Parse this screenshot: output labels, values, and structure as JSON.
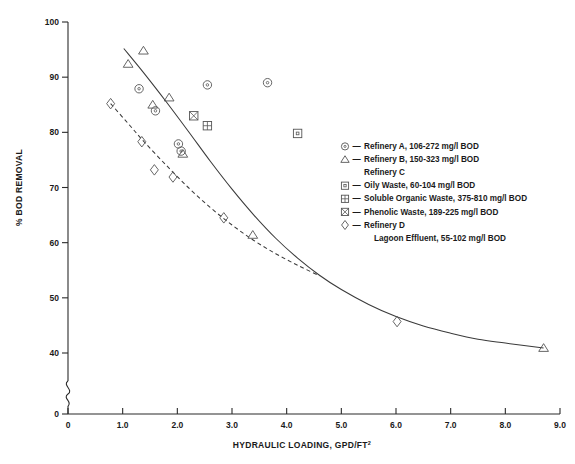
{
  "chart_data": {
    "type": "scatter",
    "title": "",
    "xlabel": "HYDRAULIC LOADING, GPD/FT",
    "xlabel_sup": "2",
    "ylabel": "% BOD REMOVAL",
    "xlim": [
      0,
      9.0
    ],
    "ylim": [
      40,
      100
    ],
    "y_axis_break": true,
    "y_break_label": "0",
    "grid": false,
    "xticks": [
      "0",
      "1.0",
      "2.0",
      "3.0",
      "4.0",
      "5.0",
      "6.0",
      "7.0",
      "8.0",
      "9.0"
    ],
    "xtick_values": [
      0,
      1,
      2,
      3,
      4,
      5,
      6,
      7,
      8,
      9
    ],
    "yticks": [
      "40",
      "50",
      "60",
      "70",
      "80",
      "90",
      "100"
    ],
    "ytick_values": [
      40,
      50,
      60,
      70,
      80,
      90,
      100
    ],
    "legend_position": "right",
    "legend": [
      {
        "symbol": "circle",
        "dash": "—",
        "label": "Refinery A, 106-272 mg/l BOD"
      },
      {
        "symbol": "triangle",
        "dash": "—",
        "label": "Refinery B, 150-323 mg/l BOD"
      },
      {
        "symbol": "none",
        "dash": "",
        "label": "Refinery C"
      },
      {
        "symbol": "square",
        "dash": "—",
        "label": "Oily Waste, 60-104 mg/l BOD"
      },
      {
        "symbol": "square-plus",
        "dash": "—",
        "label": "Soluble Organic Waste, 375-810 mg/l BOD"
      },
      {
        "symbol": "square-cross",
        "dash": "—",
        "label": "Phenolic Waste, 189-225 mg/l BOD"
      },
      {
        "symbol": "diamond",
        "dash": "—",
        "label": "Refinery D"
      },
      {
        "symbol": "none",
        "dash": "",
        "label": "Lagoon Effluent, 55-102 mg/l BOD"
      }
    ],
    "series": [
      {
        "name": "Refinery A, 106-272 mg/l BOD",
        "symbol": "circle",
        "points": [
          [
            1.3,
            87.9
          ],
          [
            1.6,
            83.9
          ],
          [
            2.02,
            77.9
          ],
          [
            2.55,
            88.6
          ],
          [
            3.65,
            89.0
          ],
          [
            2.07,
            76.6
          ]
        ]
      },
      {
        "name": "Refinery B, 150-323 mg/l BOD",
        "symbol": "triangle",
        "points": [
          [
            1.1,
            92.4
          ],
          [
            1.38,
            94.8
          ],
          [
            1.55,
            85.0
          ],
          [
            1.85,
            86.3
          ],
          [
            2.1,
            76.1
          ],
          [
            3.38,
            61.4
          ],
          [
            8.7,
            40.9
          ]
        ]
      },
      {
        "name": "Oily Waste, 60-104 mg/l BOD",
        "symbol": "square",
        "points": [
          [
            4.2,
            79.8
          ]
        ]
      },
      {
        "name": "Soluble Organic Waste, 375-810 mg/l BOD",
        "symbol": "square-plus",
        "points": [
          [
            2.55,
            81.2
          ]
        ]
      },
      {
        "name": "Phenolic Waste, 189-225 mg/l BOD",
        "symbol": "square-cross",
        "points": [
          [
            2.3,
            83.0
          ]
        ]
      },
      {
        "name": "Refinery D Lagoon Effluent, 55-102 mg/l BOD",
        "symbol": "diamond",
        "points": [
          [
            0.78,
            85.2
          ],
          [
            1.35,
            78.3
          ],
          [
            1.58,
            73.2
          ],
          [
            1.92,
            71.9
          ],
          [
            2.85,
            64.5
          ],
          [
            6.02,
            45.7
          ]
        ]
      }
    ],
    "curves": [
      {
        "name": "solid-fitted-curve",
        "style": "solid",
        "points": [
          [
            1.02,
            95.2
          ],
          [
            1.4,
            90.6
          ],
          [
            1.8,
            85.5
          ],
          [
            2.2,
            80.2
          ],
          [
            2.6,
            74.8
          ],
          [
            3.0,
            69.7
          ],
          [
            3.4,
            65.0
          ],
          [
            3.8,
            60.8
          ],
          [
            4.2,
            57.2
          ],
          [
            4.6,
            54.1
          ],
          [
            5.0,
            51.5
          ],
          [
            5.5,
            48.8
          ],
          [
            6.0,
            46.6
          ],
          [
            6.5,
            44.9
          ],
          [
            7.0,
            43.6
          ],
          [
            7.5,
            42.5
          ],
          [
            8.0,
            41.8
          ],
          [
            8.7,
            40.9
          ]
        ]
      },
      {
        "name": "dashed-lagoon-curve",
        "style": "dashed",
        "points": [
          [
            0.78,
            85.2
          ],
          [
            1.1,
            81.6
          ],
          [
            1.4,
            78.2
          ],
          [
            1.8,
            74.0
          ],
          [
            2.2,
            70.0
          ],
          [
            2.6,
            66.4
          ],
          [
            3.0,
            63.2
          ],
          [
            3.4,
            60.4
          ],
          [
            3.8,
            58.0
          ],
          [
            4.2,
            55.9
          ],
          [
            4.6,
            54.0
          ]
        ]
      }
    ]
  }
}
